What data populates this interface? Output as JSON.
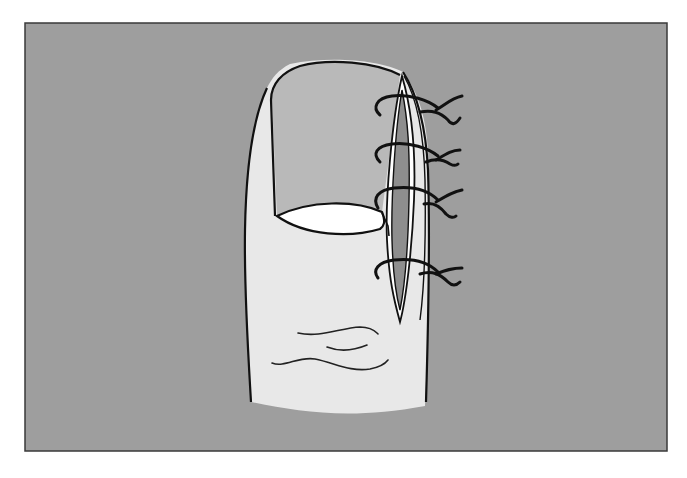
{
  "figure": {
    "colors": {
      "page_background": "#ffffff",
      "panel_background": "#9e9e9e",
      "panel_border": "#3a3a3a",
      "skin": "#e8e8e8",
      "nail_plate": "#b9b9b9",
      "lunula": "#ffffff",
      "incision_inner": "#8e8e8e",
      "outline": "#111111"
    },
    "suture_count": 4
  }
}
